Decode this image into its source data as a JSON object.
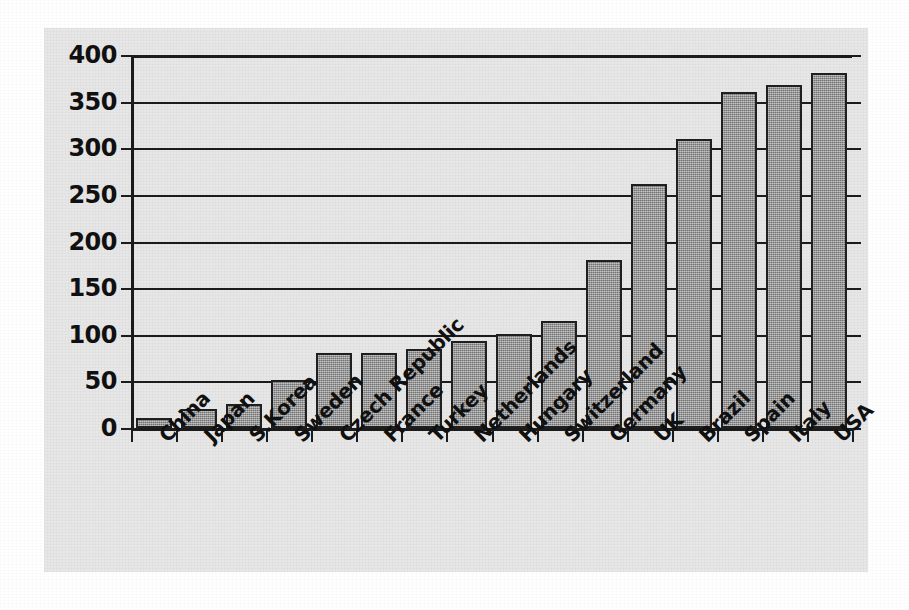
{
  "chart_data": {
    "type": "bar",
    "title": "",
    "subtitle": "",
    "xlabel": "",
    "ylabel": "",
    "ylim": [
      0,
      400
    ],
    "yticks": [
      0,
      50,
      100,
      150,
      200,
      250,
      300,
      350,
      400
    ],
    "grid": true,
    "legend": false,
    "legend_position": "none",
    "orientation": "vertical",
    "bar_color": "#8d8d8d",
    "bar_edge_color": "#1f1f1f",
    "axis_color": "#1b1b1b",
    "panel_background": "#e7e7e7",
    "page_background": "#ffffff",
    "categories": [
      "China",
      "Japan",
      "S.Korea",
      "Sweden",
      "Czech Republic",
      "France",
      "Turkey",
      "Netherlands",
      "Hungary",
      "Switzerland",
      "Germany",
      "UK",
      "Brazil",
      "Spain",
      "Italy",
      "USA"
    ],
    "values": [
      11,
      20,
      26,
      51,
      80,
      80,
      85,
      93,
      101,
      115,
      180,
      262,
      310,
      360,
      368,
      381
    ]
  }
}
